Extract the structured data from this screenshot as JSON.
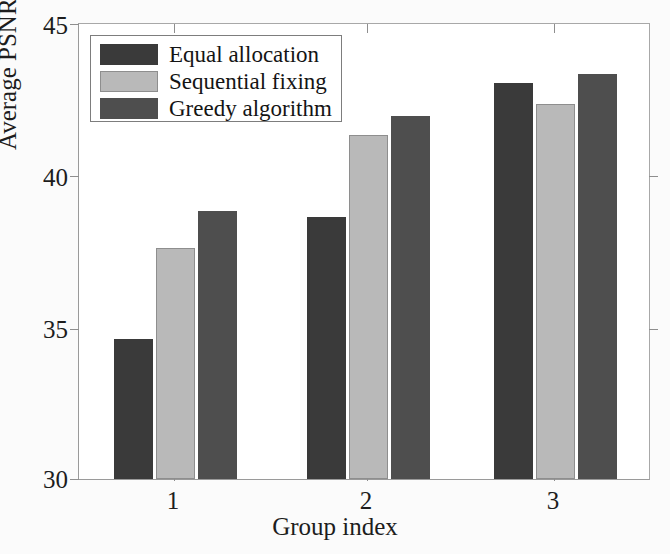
{
  "chart_data": {
    "type": "bar",
    "title": "",
    "xlabel": "Group index",
    "ylabel": "Average PSNR(dB)",
    "categories": [
      "1",
      "2",
      "3"
    ],
    "xtick_labels": [
      "1",
      "2",
      "3"
    ],
    "ytick_labels": [
      "30",
      "35",
      "40",
      "45"
    ],
    "ytick_values": [
      30,
      35,
      40,
      45
    ],
    "ylim": [
      30,
      45
    ],
    "xlim": [
      0.5,
      3.5
    ],
    "grid": false,
    "legend_position": "upper left",
    "series": [
      {
        "name": "Equal allocation",
        "color": "#3a3a3a",
        "values": [
          34.6,
          38.6,
          43.0
        ]
      },
      {
        "name": "Sequential fixing",
        "color": "#b9b9b9",
        "values": [
          37.6,
          41.3,
          42.3
        ]
      },
      {
        "name": "Greedy algorithm",
        "color": "#4e4e4e",
        "values": [
          38.8,
          41.9,
          43.3
        ]
      }
    ]
  },
  "legend": {
    "items": [
      {
        "label": "Equal allocation"
      },
      {
        "label": "Sequential fixing"
      },
      {
        "label": "Greedy algorithm"
      }
    ]
  },
  "axes": {
    "y_title": "Average PSNR(dB)",
    "x_title": "Group index",
    "y_ticks": [
      "30",
      "35",
      "40",
      "45"
    ],
    "x_ticks": [
      "1",
      "2",
      "3"
    ]
  },
  "colors": {
    "series_1": "#3a3a3a",
    "series_2": "#b9b9b9",
    "series_3": "#4e4e4e",
    "axis": "#9a9a9a",
    "background": "#fbfbfb",
    "plot_background": "#ffffff"
  }
}
